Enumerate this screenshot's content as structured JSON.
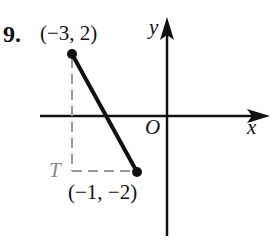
{
  "problem": {
    "number": "9.",
    "point_a_label": "(−3, 2)",
    "point_b_label": "(−1, −2)",
    "corner_label": "T",
    "origin_label": "O",
    "x_axis_label": "x",
    "y_axis_label": "y"
  },
  "colors": {
    "ink": "#111111",
    "dashed": "#999999"
  }
}
